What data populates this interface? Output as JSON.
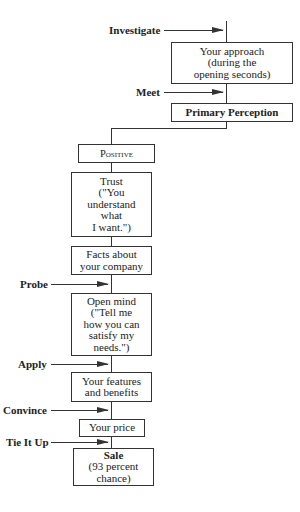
{
  "diagram": {
    "type": "flowchart",
    "nodes": {
      "approach": "Your approach\n(during the\nopening seconds)",
      "primary_perception": "Primary Perception",
      "positive": "Positive",
      "trust": "Trust\n(\"You\nunderstand\nwhat\nI want.\")",
      "facts": "Facts about\nyour company",
      "open_mind": "Open mind\n(\"Tell me\nhow you can\nsatisfy my\nneeds.\")",
      "features": "Your features\nand benefits",
      "price": "Your price",
      "sale": "Sale\n(93 percent\nchance)"
    },
    "steps": {
      "investigate": "Investigate",
      "meet": "Meet",
      "probe": "Probe",
      "apply": "Apply",
      "convince": "Convince",
      "tie_it_up": "Tie It Up"
    },
    "colors": {
      "line": "#333333",
      "background": "#ffffff",
      "text": "#222222"
    }
  }
}
